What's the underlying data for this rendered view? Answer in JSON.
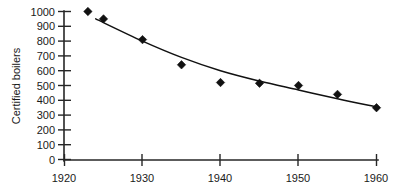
{
  "chart_data": {
    "type": "scatter",
    "title": "",
    "subtitle": "",
    "xlabel": "",
    "ylabel": "Certified boilers",
    "xlim": [
      1920,
      1960
    ],
    "ylim": [
      0,
      1000
    ],
    "xticks": [
      1920,
      1930,
      1940,
      1950,
      1960
    ],
    "yticks": [
      0,
      100,
      200,
      300,
      400,
      500,
      600,
      700,
      800,
      900,
      1000
    ],
    "xtick_labels": [
      "1920",
      "1930",
      "1940",
      "1950",
      "1960"
    ],
    "ytick_labels": [
      "0",
      "100",
      "200",
      "300",
      "400",
      "500",
      "600",
      "700",
      "800",
      "900",
      "1000"
    ],
    "grid": false,
    "legend": null,
    "marker_shape": "diamond",
    "marker_color": "#111111",
    "x": [
      1923,
      1925,
      1930,
      1935,
      1940,
      1945,
      1950,
      1955,
      1960
    ],
    "values": [
      1000,
      950,
      810,
      640,
      520,
      515,
      500,
      440,
      350
    ],
    "series": [
      {
        "name": "Certified boilers",
        "x": [
          1923,
          1925,
          1930,
          1935,
          1940,
          1945,
          1950,
          1955,
          1960
        ],
        "values": [
          1000,
          950,
          810,
          640,
          520,
          515,
          500,
          440,
          350
        ]
      }
    ],
    "trendline": {
      "type": "smooth-decay",
      "color": "#111111",
      "x": [
        1924,
        1930,
        1935,
        1940,
        1945,
        1950,
        1955,
        1960
      ],
      "values": [
        950,
        800,
        690,
        600,
        530,
        470,
        410,
        355
      ]
    },
    "annotations": []
  }
}
